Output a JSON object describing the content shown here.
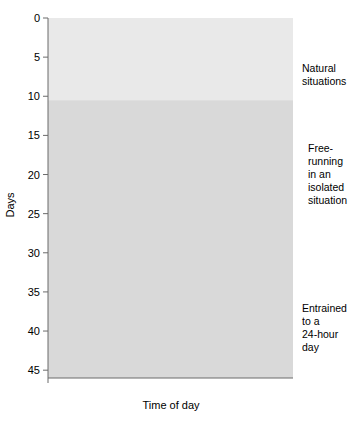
{
  "figure": {
    "background": "#ffffff",
    "plot_bg_light": "#e9e9e9",
    "plot_bg_dark": "#d9d9d9",
    "ink": "#3a3a3a"
  },
  "axes": {
    "y_title": "Days",
    "x_title": "Time of day",
    "y_ticks": [
      "0",
      "5",
      "10",
      "15",
      "20",
      "25",
      "30",
      "35",
      "40",
      "45"
    ],
    "x_ticks": [
      "Midnight",
      "Noon",
      "Midnight",
      "Noon",
      "Midnight"
    ]
  },
  "annotations": {
    "natural": "Natural\nsituations",
    "natural_line1": "Natural",
    "natural_line2": "situations",
    "freerun_line1": "Free-",
    "freerun_line2": "running",
    "freerun_line3": "in an",
    "freerun_line4": "isolated",
    "freerun_line5": "situation",
    "entrained_line1": "Entrained",
    "entrained_line2": "to a",
    "entrained_line3": "24-hour",
    "entrained_line4": "day"
  },
  "chart_data": {
    "type": "actogram",
    "title": "",
    "xlabel": "Time of day",
    "ylabel": "Days",
    "xlim_hours": [
      0,
      48
    ],
    "ylim_days": [
      0,
      46
    ],
    "grid": false,
    "legend": null,
    "x_tick_hours": [
      0,
      12,
      24,
      36,
      48
    ],
    "x_tick_labels": [
      "Midnight",
      "Noon",
      "Midnight",
      "Noon",
      "Midnight"
    ],
    "y_tick_days": [
      0,
      5,
      10,
      15,
      20,
      25,
      30,
      35,
      40,
      45
    ],
    "phases": [
      {
        "name": "Natural situations",
        "day_start": 0,
        "day_end": 10.5,
        "shade": "#e9e9e9"
      },
      {
        "name": "Free-running in an isolated situation",
        "day_start": 10.5,
        "day_end": 35,
        "shade": "#d9d9d9"
      },
      {
        "name": "Entrained to a 24-hour day",
        "day_start": 35,
        "day_end": 46,
        "shade": "#d9d9d9"
      }
    ],
    "bracket_freerunning": {
      "day_start": 10.6,
      "day_end": 35.2
    },
    "series_description": "Each row is one day. A solid bar marks the main activity bout; a triangle marks activity onset; a dotted bar continues the double-plotted 48-hour record.",
    "rows": [
      {
        "day": 1,
        "solid_start_h": 1.0,
        "solid_end_h": 12.5,
        "onset_h": 11.8,
        "dotted_end_h": 34.0
      },
      {
        "day": 2,
        "solid_start_h": 1.0,
        "solid_end_h": 12.5,
        "onset_h": 11.8,
        "dotted_end_h": 34.0
      },
      {
        "day": 3,
        "solid_start_h": 1.0,
        "solid_end_h": 12.0,
        "onset_h": 11.2,
        "dotted_end_h": 34.5
      },
      {
        "day": 4,
        "solid_start_h": 3.0,
        "solid_end_h": 14.0,
        "onset_h": 12.6,
        "dotted_end_h": 36.5
      },
      {
        "day": 5,
        "solid_start_h": 3.0,
        "solid_end_h": 14.5,
        "onset_h": 12.8,
        "dotted_end_h": 36.0
      },
      {
        "day": 6,
        "solid_start_h": 1.0,
        "solid_end_h": 12.5,
        "onset_h": 11.6,
        "dotted_end_h": 35.0
      },
      {
        "day": 7,
        "solid_start_h": 1.0,
        "solid_end_h": 12.8,
        "onset_h": 11.6,
        "dotted_end_h": 35.0
      },
      {
        "day": 8,
        "solid_start_h": 1.0,
        "solid_end_h": 13.0,
        "onset_h": 12.0,
        "dotted_end_h": 35.0
      },
      {
        "day": 9,
        "solid_start_h": 1.0,
        "solid_end_h": 13.0,
        "onset_h": 12.0,
        "dotted_end_h": 35.5
      },
      {
        "day": 10,
        "solid_start_h": 1.2,
        "solid_end_h": 13.8,
        "onset_h": 12.2,
        "dotted_end_h": 37.0
      },
      {
        "day": 11,
        "solid_start_h": 1.8,
        "solid_end_h": 13.8,
        "onset_h": 12.4,
        "dotted_end_h": 37.5
      },
      {
        "day": 12,
        "solid_start_h": 2.5,
        "solid_end_h": 14.0,
        "onset_h": 12.4,
        "dotted_end_h": 36.0
      },
      {
        "day": 13,
        "solid_start_h": 5.5,
        "solid_end_h": 14.0,
        "onset_h": 12.6,
        "dotted_end_h": 37.5
      },
      {
        "day": 14,
        "solid_start_h": 8.0,
        "solid_end_h": 16.0,
        "onset_h": 13.8,
        "dotted_end_h": 39.5
      },
      {
        "day": 15,
        "solid_start_h": 13.0,
        "solid_end_h": 24.0,
        "onset_h": 13.4,
        "dotted_end_h": 41.0
      },
      {
        "day": 16,
        "solid_start_h": 14.0,
        "solid_end_h": 25.5,
        "onset_h": 14.2,
        "dotted_end_h": 42.0
      },
      {
        "day": 17,
        "solid_start_h": 15.2,
        "solid_end_h": 26.5,
        "onset_h": 15.2,
        "dotted_end_h": 43.0
      },
      {
        "day": 18,
        "solid_start_h": 16.5,
        "solid_end_h": 28.0,
        "onset_h": 16.5,
        "dotted_end_h": 44.0
      },
      {
        "day": 19,
        "solid_start_h": 17.5,
        "solid_end_h": 29.5,
        "onset_h": 17.5,
        "dotted_end_h": 45.0
      },
      {
        "day": 20,
        "solid_start_h": 18.5,
        "solid_end_h": 30.5,
        "onset_h": 18.5,
        "dotted_end_h": 45.5
      },
      {
        "day": 21,
        "solid_start_h": 19.8,
        "solid_end_h": 31.5,
        "onset_h": 19.8,
        "dotted_end_h": 46.0
      },
      {
        "day": 22,
        "solid_start_h": 20.8,
        "solid_end_h": 32.5,
        "onset_h": 20.8,
        "dotted_end_h": 46.5
      },
      {
        "day": 23,
        "solid_start_h": 21.8,
        "solid_end_h": 33.5,
        "onset_h": 21.8,
        "dotted_end_h": 47.0
      },
      {
        "day": 24,
        "solid_start_h": 22.8,
        "solid_end_h": 34.5,
        "onset_h": 22.8,
        "dotted_end_h": 47.5
      },
      {
        "day": 25,
        "solid_start_h": 23.5,
        "solid_end_h": 35.0,
        "onset_h": 23.5,
        "dotted_end_h": 47.8
      },
      {
        "day": 26,
        "solid_start_h": 24.2,
        "solid_end_h": 36.0,
        "onset_h": 24.2,
        "dotted_end_h": 48.0
      },
      {
        "day": 27,
        "solid_start_h": 25.0,
        "solid_end_h": 37.0,
        "onset_h": 25.0,
        "dotted_end_h": 48.0
      },
      {
        "day": 28,
        "solid_start_h": 26.0,
        "solid_end_h": 38.0,
        "onset_h": 26.0,
        "dotted_end_h": 48.0
      },
      {
        "day": 29,
        "solid_start_h": 26.8,
        "solid_end_h": 38.5,
        "onset_h": 26.8,
        "dotted_end_h": 48.0
      },
      {
        "day": 30,
        "solid_start_h": 27.5,
        "solid_end_h": 39.0,
        "onset_h": 27.5,
        "dotted_end_h": 48.0
      },
      {
        "day": 31,
        "solid_start_h": 28.2,
        "solid_end_h": 39.5,
        "onset_h": 28.2,
        "dotted_end_h": 48.0
      },
      {
        "day": 32,
        "solid_start_h": 29.0,
        "solid_end_h": 40.0,
        "onset_h": 29.0,
        "dotted_end_h": 48.0
      },
      {
        "day": 33,
        "solid_start_h": 29.5,
        "solid_end_h": 40.5,
        "onset_h": 29.5,
        "dotted_end_h": 48.0
      },
      {
        "day": 34,
        "solid_start_h": 30.0,
        "solid_end_h": 41.0,
        "onset_h": 30.0,
        "dotted_end_h": 48.0
      },
      {
        "day": 35,
        "solid_start_h": 30.0,
        "solid_end_h": 41.0,
        "onset_h": 30.0,
        "dotted_end_h": 48.0
      },
      {
        "day": 36,
        "solid_start_h": 30.0,
        "solid_end_h": 41.0,
        "onset_h": 30.0,
        "dotted_end_h": 48.0
      },
      {
        "day": 37,
        "solid_start_h": 30.0,
        "solid_end_h": 41.0,
        "onset_h": 30.0,
        "dotted_end_h": 48.0
      },
      {
        "day": 38,
        "solid_start_h": 30.0,
        "solid_end_h": 41.0,
        "onset_h": 30.0,
        "dotted_end_h": 48.0
      },
      {
        "day": 39,
        "solid_start_h": 30.0,
        "solid_end_h": 41.0,
        "onset_h": 30.0,
        "dotted_end_h": 48.0
      },
      {
        "day": 40,
        "solid_start_h": 28.8,
        "solid_end_h": 41.0,
        "onset_h": 30.6,
        "dotted_end_h": 48.0
      },
      {
        "day": 41,
        "solid_start_h": 28.2,
        "solid_end_h": 41.0,
        "onset_h": 30.8,
        "dotted_end_h": 48.0
      },
      {
        "day": 42,
        "solid_start_h": 28.2,
        "solid_end_h": 41.0,
        "onset_h": 30.8,
        "dotted_end_h": 48.0
      },
      {
        "day": 43,
        "solid_start_h": 28.2,
        "solid_end_h": 41.0,
        "onset_h": 30.8,
        "dotted_end_h": 48.0
      },
      {
        "day": 44,
        "solid_start_h": 28.2,
        "solid_end_h": 41.0,
        "onset_h": 30.8,
        "dotted_end_h": 48.0
      },
      {
        "day": 45,
        "solid_start_h": 28.2,
        "solid_end_h": 41.0,
        "onset_h": 30.8,
        "dotted_end_h": 48.0
      }
    ]
  }
}
